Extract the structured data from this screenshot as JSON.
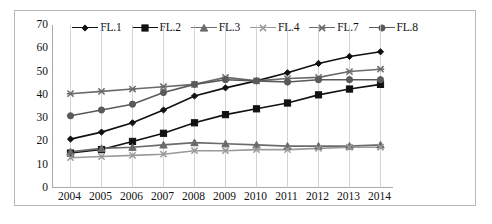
{
  "chart_data": {
    "type": "line",
    "title": "",
    "xlabel": "",
    "ylabel": "",
    "categories": [
      "2004",
      "2005",
      "2006",
      "2007",
      "2008",
      "2009",
      "2010",
      "2011",
      "2012",
      "2013",
      "2014"
    ],
    "yticks": [
      0,
      10,
      20,
      30,
      40,
      50,
      60,
      70
    ],
    "ylim": [
      0,
      70
    ],
    "grid": "vertical",
    "legend_position": "top-center",
    "series": [
      {
        "name": "FL.1",
        "marker": "diamond",
        "color": "#111111",
        "values": [
          21,
          24,
          28,
          33.5,
          39.5,
          43,
          46,
          49.5,
          53.5,
          56.5,
          58.5
        ]
      },
      {
        "name": "FL.2",
        "marker": "square",
        "color": "#111111",
        "values": [
          15,
          16.5,
          20,
          23.5,
          28,
          31.5,
          34,
          36.5,
          40,
          42.5,
          44.5
        ]
      },
      {
        "name": "FL.3",
        "marker": "triangle",
        "color": "#6b6b6b",
        "values": [
          15.5,
          17,
          17.5,
          18.5,
          19.5,
          19,
          18.5,
          18,
          18,
          18,
          18.5
        ]
      },
      {
        "name": "FL.4",
        "marker": "cross",
        "color": "#9a9a9a",
        "values": [
          13,
          13.5,
          14,
          14.5,
          16,
          16,
          16.5,
          16.5,
          17,
          17.5,
          17.5
        ]
      },
      {
        "name": "FL.7",
        "marker": "asterisk",
        "color": "#6b6b6b",
        "values": [
          40.5,
          41.5,
          42.5,
          43.5,
          44.5,
          47.5,
          46,
          47,
          47.5,
          50,
          51
        ]
      },
      {
        "name": "FL.8",
        "marker": "circle",
        "color": "#5a5a5a",
        "values": [
          31,
          33.5,
          36,
          41,
          44.5,
          46.5,
          46,
          45.5,
          46.5,
          46.5,
          46.5
        ]
      }
    ]
  },
  "legend": {
    "items": [
      {
        "label": "FL.1",
        "marker": "diamond"
      },
      {
        "label": "FL.2",
        "marker": "square"
      },
      {
        "label": "FL.3",
        "marker": "triangle"
      },
      {
        "label": "FL.4",
        "marker": "cross"
      },
      {
        "label": "FL.7",
        "marker": "asterisk"
      },
      {
        "label": "FL.8",
        "marker": "circle"
      }
    ]
  }
}
